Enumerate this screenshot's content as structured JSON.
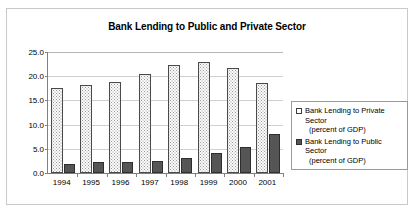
{
  "chart_data": {
    "type": "bar",
    "title": "Bank Lending to Public and Private Sector",
    "xlabel": "",
    "ylabel": "",
    "ylim": [
      0.0,
      25.0
    ],
    "ytick_step": 5.0,
    "grid": true,
    "legend_position": "right",
    "categories": [
      "1994",
      "1995",
      "1996",
      "1997",
      "1998",
      "1999",
      "2000",
      "2001"
    ],
    "ytick_labels": [
      "0.0",
      "5.0",
      "10.0",
      "15.0",
      "20.0",
      "25.0"
    ],
    "series": [
      {
        "name": "Bank Lending to Private Sector",
        "unit": "(percent of GDP)",
        "style": "hollow-dotted",
        "color": "#fbfbfb",
        "border_color": "#4a4a4a",
        "values": [
          17.5,
          18.1,
          18.8,
          20.4,
          22.4,
          23.0,
          21.7,
          18.6
        ]
      },
      {
        "name": "Bank Lending to Public Sector",
        "unit": "(percent of GDP)",
        "style": "solid-dark",
        "color": "#555555",
        "border_color": "#2e2e2e",
        "values": [
          1.9,
          2.2,
          2.3,
          2.4,
          3.1,
          4.2,
          5.3,
          8.0
        ]
      }
    ]
  },
  "legend": {
    "entries": [
      {
        "label": "Bank Lending to Private Sector",
        "sub": "(percent of GDP)"
      },
      {
        "label": "Bank Lending to Public Sector",
        "sub": "(percent of GDP)"
      }
    ]
  }
}
